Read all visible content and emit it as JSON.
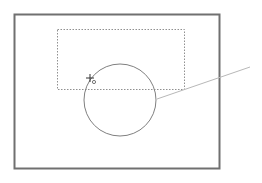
{
  "canvas": {
    "width": 262,
    "height": 183,
    "background": "#ffffff"
  },
  "colors": {
    "frame": "#707070",
    "shape": "#808080",
    "selection": "#909090",
    "leader": "#b8b8b8"
  },
  "frame": {
    "x": 14,
    "y": 14,
    "width": 205,
    "height": 154
  },
  "selection_marquee": {
    "x": 57,
    "y": 29,
    "width": 127,
    "height": 60
  },
  "circle": {
    "cx": 120,
    "cy": 100,
    "r": 36
  },
  "leader_line": {
    "x1": 157,
    "y1": 99,
    "x2": 250,
    "y2": 67
  },
  "cursor": {
    "x": 90,
    "y": 78,
    "type": "crosshair-with-circle"
  }
}
